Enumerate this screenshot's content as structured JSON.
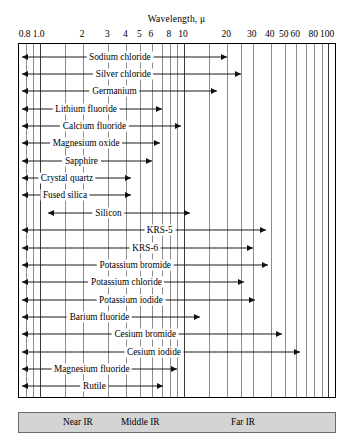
{
  "axis": {
    "title": "Wavelength, μ",
    "scale": "log",
    "xlim": [
      0.72,
      115
    ],
    "tick_labels": [
      "0.8",
      "1.0",
      "2",
      "3",
      "4",
      "5",
      "6",
      "8",
      "10",
      "20",
      "30",
      "40",
      "50",
      "60",
      "80",
      "100"
    ],
    "tick_values": [
      0.8,
      1.0,
      2,
      3,
      4,
      5,
      6,
      8,
      10,
      20,
      30,
      40,
      50,
      60,
      80,
      100
    ],
    "gridline_values": [
      0.8,
      0.9,
      1.0,
      1.5,
      2,
      3,
      4,
      5,
      6,
      7,
      8,
      9,
      10,
      15,
      20,
      25,
      30,
      40,
      50,
      60,
      70,
      80,
      90,
      100
    ],
    "major_gridline_values": [
      1.0,
      10,
      100
    ]
  },
  "chart_data": {
    "type": "bar",
    "orientation": "horizontal",
    "title": "Wavelength, μ",
    "xlabel": "Wavelength, μ",
    "ylabel": "",
    "xscale": "log",
    "xlim": [
      0.72,
      115
    ],
    "grid": true,
    "legend_position": "bottom",
    "categories": [
      "Sodium chloride",
      "Silver chloride",
      "Germanium",
      "Lithium fluoride",
      "Calcium fluoride",
      "Magnesium oxide",
      "Sapphire",
      "Crystal quartz",
      "Fused silica",
      "Silicon",
      "KRS-5",
      "KRS-6",
      "Potassium bromide",
      "Potassium chloride",
      "Potassium iodide",
      "Barium fluoride",
      "Cesium bromide",
      "Cesium iodide",
      "Magnesium fluoride",
      "Rutile"
    ],
    "ranges": [
      {
        "name": "Sodium chloride",
        "min": 0.75,
        "max": 20.0,
        "arrow_left": true,
        "arrow_right": true,
        "label_x": 3.6
      },
      {
        "name": "Silver chloride",
        "min": 0.75,
        "max": 25.0,
        "arrow_left": true,
        "arrow_right": true,
        "label_x": 3.8
      },
      {
        "name": "Germanium",
        "min": 0.75,
        "max": 17.0,
        "arrow_left": true,
        "arrow_right": true,
        "label_x": 3.3
      },
      {
        "name": "Lithium fluoride",
        "min": 0.75,
        "max": 7.0,
        "arrow_left": true,
        "arrow_right": true,
        "label_x": 2.1
      },
      {
        "name": "Calcium fluoride",
        "min": 0.75,
        "max": 9.5,
        "arrow_left": true,
        "arrow_right": true,
        "label_x": 2.4
      },
      {
        "name": "Magnesium oxide",
        "min": 0.75,
        "max": 6.8,
        "arrow_left": true,
        "arrow_right": true,
        "label_x": 2.1
      },
      {
        "name": "Sapphire",
        "min": 0.75,
        "max": 6.0,
        "arrow_left": true,
        "arrow_right": true,
        "label_x": 1.95
      },
      {
        "name": "Crystal quartz",
        "min": 0.75,
        "max": 4.3,
        "arrow_left": true,
        "arrow_right": true,
        "label_x": 1.55
      },
      {
        "name": "Fused silica",
        "min": 0.75,
        "max": 4.3,
        "arrow_left": true,
        "arrow_right": true,
        "label_x": 1.5
      },
      {
        "name": "Silicon",
        "min": 1.15,
        "max": 11.0,
        "arrow_left": true,
        "arrow_right": true,
        "label_x": 3.0
      },
      {
        "name": "KRS-5",
        "min": 0.75,
        "max": 37.0,
        "arrow_left": true,
        "arrow_right": true,
        "label_x": 6.8
      },
      {
        "name": "KRS-6",
        "min": 0.75,
        "max": 30.0,
        "arrow_left": true,
        "arrow_right": true,
        "label_x": 5.4
      },
      {
        "name": "Potassium bromide",
        "min": 0.75,
        "max": 38.0,
        "arrow_left": true,
        "arrow_right": true,
        "label_x": 4.6
      },
      {
        "name": "Potassium chloride",
        "min": 0.75,
        "max": 26.0,
        "arrow_left": true,
        "arrow_right": true,
        "label_x": 4.0
      },
      {
        "name": "Potassium iodide",
        "min": 0.75,
        "max": 31.0,
        "arrow_left": true,
        "arrow_right": true,
        "label_x": 4.3
      },
      {
        "name": "Barium fluoride",
        "min": 0.75,
        "max": 13.0,
        "arrow_left": true,
        "arrow_right": true,
        "label_x": 2.6
      },
      {
        "name": "Cesium bromide",
        "min": 0.75,
        "max": 48.0,
        "arrow_left": true,
        "arrow_right": true,
        "label_x": 5.4
      },
      {
        "name": "Cesium iodide",
        "min": 0.75,
        "max": 64.0,
        "arrow_left": true,
        "arrow_right": true,
        "label_x": 6.2
      },
      {
        "name": "Magnesium fluoride",
        "min": 0.75,
        "max": 9.0,
        "arrow_left": true,
        "arrow_right": true,
        "label_x": 2.3
      },
      {
        "name": "Rutile",
        "min": 0.75,
        "max": 7.2,
        "arrow_left": true,
        "arrow_right": true,
        "label_x": 2.4
      }
    ]
  },
  "legend": {
    "items": [
      {
        "label": "Near IR",
        "x_px": 44
      },
      {
        "label": "Middle IR",
        "x_px": 102
      },
      {
        "label": "Far IR",
        "x_px": 212
      }
    ]
  },
  "colors": {
    "frame": "#000000",
    "gridline": "#8d8d8d",
    "gridline_major": "#3a3a3a",
    "bar": "#1a1a1a",
    "legend_band": "#d4d4d4",
    "background": "#ffffff"
  }
}
